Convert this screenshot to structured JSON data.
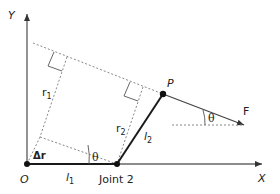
{
  "labels": {
    "y_axis": "Y",
    "x_axis": "X",
    "origin": "O",
    "joint2": "Joint 2",
    "point_p": "P",
    "force": "F",
    "r1_main": "r",
    "r1_sub": "1",
    "r2_main": "r",
    "r2_sub": "2",
    "l1_main": "l",
    "l1_sub": "1",
    "l2_main": "l",
    "l2_sub": "2",
    "delta_r": "Δr",
    "theta_low": "θ",
    "theta_force": "θ"
  },
  "colors": {
    "axis": "#555555",
    "link": "#1a1a1a",
    "dotted": "#888888",
    "text": "#222222"
  }
}
